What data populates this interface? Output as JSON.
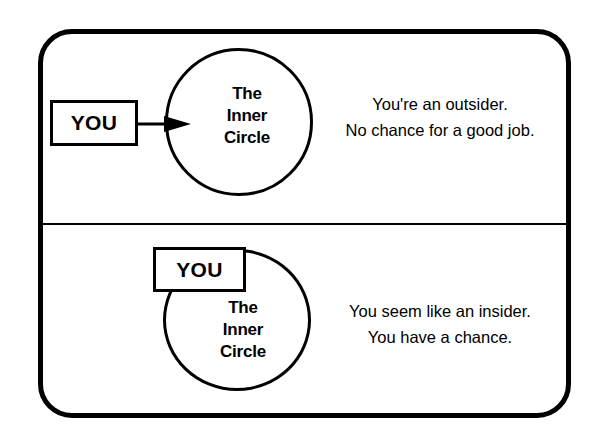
{
  "diagram": {
    "title": "The Inner Circle",
    "colors": {
      "stroke": "#000000",
      "background": "#ffffff"
    },
    "panels": [
      {
        "id": "outsider",
        "you_label": "YOU",
        "circle_label_lines": [
          "The",
          "Inner",
          "Circle"
        ],
        "connector": "arrow-right",
        "caption_lines": [
          "You're an outsider.",
          "No chance for a good job."
        ]
      },
      {
        "id": "insider",
        "you_label": "YOU",
        "circle_label_lines": [
          "The",
          "Inner",
          "Circle"
        ],
        "connector": "overlap",
        "caption_lines": [
          "You seem like an insider.",
          "You have a chance."
        ]
      }
    ]
  }
}
